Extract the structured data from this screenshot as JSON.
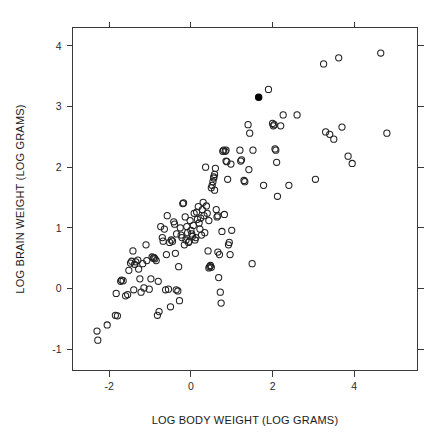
{
  "chart_data": {
    "type": "scatter",
    "title": "",
    "xlabel": "LOG BODY WEIGHT (LOG GRAMS)",
    "ylabel": "LOG BRAIN WEIGHT (LOG GRAMS)",
    "xlim": [
      -2.9,
      5.55
    ],
    "ylim": [
      -1.35,
      4.3
    ],
    "xticks": [
      -2,
      0,
      2,
      4
    ],
    "xticklabels": [
      "-2",
      "0",
      "2",
      "4"
    ],
    "yticks": [
      -1,
      0,
      1,
      2,
      3,
      4
    ],
    "yticklabels": [
      "-1",
      "0",
      "1",
      "2",
      "3",
      "4"
    ],
    "grid": false,
    "legend": null,
    "frame": "box",
    "tick_direction": "out",
    "marker": "open-circle",
    "marker_size_px": 5.2,
    "highlight_marker": "filled-circle",
    "highlight_note": "single filled black point",
    "n_points": 162,
    "series": [
      {
        "name": "mammals",
        "marker": "open-circle",
        "color": "#1f1f1f",
        "points": [
          [
            -2.3,
            -0.7
          ],
          [
            -2.28,
            -0.85
          ],
          [
            -2.05,
            -0.6
          ],
          [
            -1.85,
            -0.44
          ],
          [
            -1.83,
            -0.08
          ],
          [
            -1.8,
            -0.45
          ],
          [
            -1.72,
            0.12
          ],
          [
            -1.7,
            0.14
          ],
          [
            -1.66,
            0.13
          ],
          [
            -1.55,
            -0.1
          ],
          [
            -1.52,
            0.3
          ],
          [
            -1.48,
            0.42
          ],
          [
            -1.45,
            0.45
          ],
          [
            -1.42,
            0.62
          ],
          [
            -1.4,
            -0.02
          ],
          [
            -1.38,
            0.4
          ],
          [
            -1.35,
            0.44
          ],
          [
            -1.3,
            0.47
          ],
          [
            -1.28,
            0.32
          ],
          [
            -1.22,
            -0.06
          ],
          [
            -1.18,
            0.41
          ],
          [
            -1.15,
            0.01
          ],
          [
            -1.1,
            0.72
          ],
          [
            -1.08,
            0.46
          ],
          [
            -1.02,
            -0.01
          ],
          [
            -0.98,
            0.16
          ],
          [
            -0.95,
            0.52
          ],
          [
            -0.92,
            0.5
          ],
          [
            -0.9,
            0.51
          ],
          [
            -0.88,
            0.49
          ],
          [
            -0.85,
            0.46
          ],
          [
            -0.82,
            -0.44
          ],
          [
            -0.8,
            0.12
          ],
          [
            -0.78,
            -0.38
          ],
          [
            -0.74,
            1.02
          ],
          [
            -0.7,
            0.84
          ],
          [
            -0.68,
            0.78
          ],
          [
            -0.65,
            0.98
          ],
          [
            -0.62,
            -0.02
          ],
          [
            -0.6,
            0.56
          ],
          [
            -0.58,
            1.2
          ],
          [
            -0.55,
            -0.01
          ],
          [
            -0.52,
            0.76
          ],
          [
            -0.5,
            -0.3
          ],
          [
            -0.48,
            0.8
          ],
          [
            -0.45,
            0.78
          ],
          [
            -0.42,
            1.1
          ],
          [
            -0.4,
            1.06
          ],
          [
            -0.38,
            0.58
          ],
          [
            -0.35,
            0.9
          ],
          [
            -0.32,
            -0.04
          ],
          [
            -0.3,
            0.36
          ],
          [
            -0.28,
            -0.2
          ],
          [
            -0.26,
            1.0
          ],
          [
            -0.24,
            0.88
          ],
          [
            -0.22,
            0.84
          ],
          [
            -0.2,
            1.4
          ],
          [
            -0.18,
            1.41
          ],
          [
            -0.16,
            0.72
          ],
          [
            -0.14,
            1.18
          ],
          [
            -0.12,
            0.8
          ],
          [
            -0.1,
            1.02
          ],
          [
            -0.08,
            0.92
          ],
          [
            -0.06,
            0.76
          ],
          [
            -0.04,
            0.78
          ],
          [
            -0.02,
            1.12
          ],
          [
            0.0,
            0.96
          ],
          [
            0.02,
            0.9
          ],
          [
            0.04,
            0.86
          ],
          [
            0.06,
            1.04
          ],
          [
            0.08,
            1.24
          ],
          [
            0.1,
            0.8
          ],
          [
            0.12,
            0.84
          ],
          [
            0.14,
            1.26
          ],
          [
            0.16,
            1.14
          ],
          [
            0.18,
            1.35
          ],
          [
            0.2,
            1.08
          ],
          [
            0.22,
            0.98
          ],
          [
            0.24,
            1.16
          ],
          [
            0.26,
            0.88
          ],
          [
            0.28,
            1.3
          ],
          [
            0.3,
            1.42
          ],
          [
            0.32,
            1.2
          ],
          [
            0.34,
            0.92
          ],
          [
            0.36,
            2.0
          ],
          [
            0.38,
            1.36
          ],
          [
            0.4,
            1.24
          ],
          [
            0.42,
            0.62
          ],
          [
            0.44,
            0.34
          ],
          [
            0.46,
            0.36
          ],
          [
            0.48,
            0.38
          ],
          [
            0.5,
            0.35
          ],
          [
            0.5,
            1.66
          ],
          [
            0.52,
            1.7
          ],
          [
            0.54,
            1.76
          ],
          [
            0.56,
            1.84
          ],
          [
            0.56,
            1.82
          ],
          [
            0.58,
            1.88
          ],
          [
            0.58,
            1.62
          ],
          [
            0.6,
            1.98
          ],
          [
            0.62,
            1.3
          ],
          [
            0.64,
            1.18
          ],
          [
            0.66,
            0.6
          ],
          [
            0.68,
            0.18
          ],
          [
            0.7,
            0.56
          ],
          [
            0.72,
            -0.06
          ],
          [
            0.74,
            -0.24
          ],
          [
            0.76,
            0.94
          ],
          [
            0.78,
            2.26
          ],
          [
            0.8,
            2.28
          ],
          [
            0.82,
            1.22
          ],
          [
            0.84,
            2.26
          ],
          [
            0.86,
            2.1
          ],
          [
            0.88,
            2.09
          ],
          [
            0.9,
            1.8
          ],
          [
            0.92,
            0.72
          ],
          [
            0.94,
            0.76
          ],
          [
            0.96,
            0.56
          ],
          [
            0.98,
            2.05
          ],
          [
            1.0,
            0.96
          ],
          [
            1.2,
            2.28
          ],
          [
            1.22,
            2.1
          ],
          [
            1.24,
            2.12
          ],
          [
            1.3,
            1.78
          ],
          [
            1.32,
            1.76
          ],
          [
            1.4,
            2.7
          ],
          [
            1.42,
            1.96
          ],
          [
            1.44,
            2.56
          ],
          [
            1.5,
            0.41
          ],
          [
            1.52,
            2.28
          ],
          [
            1.78,
            1.7
          ],
          [
            1.9,
            3.28
          ],
          [
            2.0,
            2.72
          ],
          [
            2.02,
            2.68
          ],
          [
            2.04,
            2.7
          ],
          [
            2.06,
            2.3
          ],
          [
            2.08,
            2.28
          ],
          [
            2.1,
            2.08
          ],
          [
            2.12,
            1.52
          ],
          [
            2.2,
            2.68
          ],
          [
            2.26,
            2.86
          ],
          [
            2.4,
            1.7
          ],
          [
            2.6,
            2.86
          ],
          [
            3.05,
            1.8
          ],
          [
            3.25,
            3.7
          ],
          [
            3.3,
            2.58
          ],
          [
            3.4,
            2.54
          ],
          [
            3.5,
            2.46
          ],
          [
            3.62,
            3.8
          ],
          [
            3.7,
            2.66
          ],
          [
            3.85,
            2.18
          ],
          [
            3.95,
            2.06
          ],
          [
            4.65,
            3.88
          ],
          [
            4.8,
            2.56
          ],
          [
            -1.6,
            -0.12
          ],
          [
            -1.25,
            0.16
          ],
          [
            -0.36,
            -0.02
          ],
          [
            0.44,
            1.12
          ],
          [
            0.66,
            1.2
          ],
          [
            0.86,
            2.28
          ]
        ]
      },
      {
        "name": "highlighted",
        "marker": "filled-circle",
        "color": "#000000",
        "points": [
          [
            1.66,
            3.15
          ]
        ]
      }
    ]
  },
  "axes": {
    "x_label": "LOG BODY WEIGHT (LOG GRAMS)",
    "y_label": "LOG BRAIN WEIGHT (LOG GRAMS)"
  }
}
